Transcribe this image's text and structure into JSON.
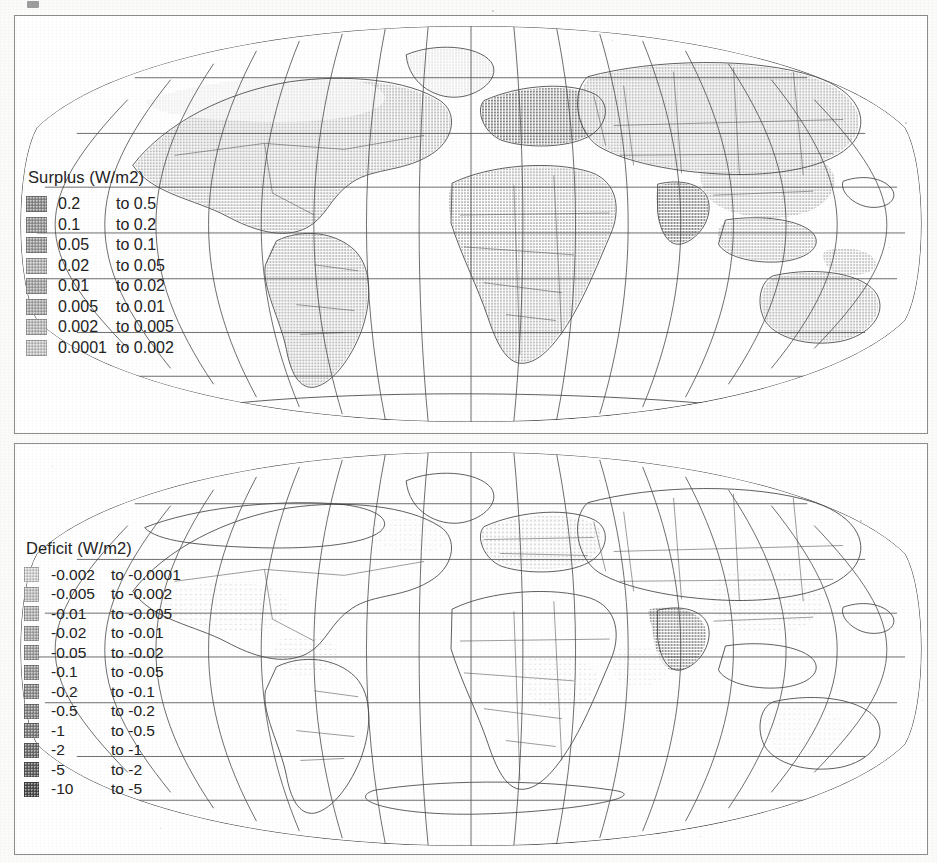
{
  "figure": {
    "type": "map-figure",
    "panel_count": 2,
    "projection": "robinson-like global graticule",
    "background_color": "#ffffff",
    "frame_color": "#8c8c8c",
    "ink_color": "#2a2a2a"
  },
  "panels": [
    {
      "id": "surplus",
      "legend": {
        "title": "Surplus (W/m2)",
        "connector": "to",
        "rows": [
          {
            "low": "0.2",
            "high": "to 0.5",
            "color": "#8e8e8e"
          },
          {
            "low": "0.1",
            "high": "to 0.2",
            "color": "#999999"
          },
          {
            "low": "0.05",
            "high": "to 0.1",
            "color": "#9f9f9f"
          },
          {
            "low": "0.02",
            "high": "to 0.05",
            "color": "#b4b4b4"
          },
          {
            "low": "0.01",
            "high": "to 0.02",
            "color": "#a8a8a8"
          },
          {
            "low": "0.005",
            "high": "to 0.01",
            "color": "#aeaeae"
          },
          {
            "low": "0.002",
            "high": "to 0.005",
            "color": "#bdbdbd"
          },
          {
            "low": "0.0001",
            "high": "to 0.002",
            "color": "#c9c9c9"
          }
        ]
      }
    },
    {
      "id": "deficit",
      "legend": {
        "title": "Deficit (W/m2)",
        "connector": "to",
        "rows": [
          {
            "low": "-0.002",
            "high": "to -0.0001",
            "color": "#d6d6d6"
          },
          {
            "low": "-0.005",
            "high": "to -0.002",
            "color": "#c4c4c4"
          },
          {
            "low": "-0.01",
            "high": "to -0.005",
            "color": "#b6b6b6"
          },
          {
            "low": "-0.02",
            "high": "to -0.01",
            "color": "#acacac"
          },
          {
            "low": "-0.05",
            "high": "to -0.02",
            "color": "#a2a2a2"
          },
          {
            "low": "-0.1",
            "high": "to -0.05",
            "color": "#9a9a9a"
          },
          {
            "low": "-0.2",
            "high": "to -0.1",
            "color": "#919191"
          },
          {
            "low": "-0.5",
            "high": "to -0.2",
            "color": "#888888"
          },
          {
            "low": "-1",
            "high": "to -0.5",
            "color": "#7e7e7e"
          },
          {
            "low": "-2",
            "high": "to -1",
            "color": "#6f6f6f"
          },
          {
            "low": "-5",
            "high": "to -2",
            "color": "#5f5f5f"
          },
          {
            "low": "-10",
            "high": "to -5",
            "color": "#4d4d4d"
          }
        ]
      }
    }
  ],
  "chart_data": {
    "type": "heatmap",
    "maps": [
      {
        "name": "Surplus (W/m2)",
        "units": "W/m2",
        "class_breaks": [
          0.0001,
          0.002,
          0.005,
          0.01,
          0.02,
          0.05,
          0.1,
          0.2,
          0.5
        ],
        "class_labels": [
          "0.0001 to 0.002",
          "0.002 to 0.005",
          "0.005 to 0.01",
          "0.01 to 0.02",
          "0.02 to 0.05",
          "0.05 to 0.1",
          "0.1 to 0.2",
          "0.2 to 0.5"
        ],
        "ramp": "light-gray (low) to dark-gray (high)",
        "coverage_note": "broad shading across North America, South America, Africa, Europe, northern Asia and Australia"
      },
      {
        "name": "Deficit (W/m2)",
        "units": "W/m2",
        "class_breaks": [
          -10,
          -5,
          -2,
          -1,
          -0.5,
          -0.2,
          -0.1,
          -0.05,
          -0.02,
          -0.01,
          -0.005,
          -0.002,
          -0.0001
        ],
        "class_labels": [
          "-0.002 to -0.0001",
          "-0.005 to -0.002",
          "-0.01 to -0.005",
          "-0.02 to -0.01",
          "-0.05 to -0.02",
          "-0.1 to -0.05",
          "-0.2 to -0.1",
          "-0.5 to -0.2",
          "-1 to -0.5",
          "-2 to -1",
          "-5 to -2",
          "-10 to -5"
        ],
        "ramp": "light-gray (near zero) to dark-gray (most negative)",
        "coverage_note": "sparse shading, concentrated over India, eastern China, Europe, eastern USA and parts of Africa"
      }
    ],
    "graticule": {
      "meridian_spacing_deg": 20,
      "parallel_spacing_deg": 20,
      "grid": true
    },
    "legend_position": "inside-left"
  }
}
